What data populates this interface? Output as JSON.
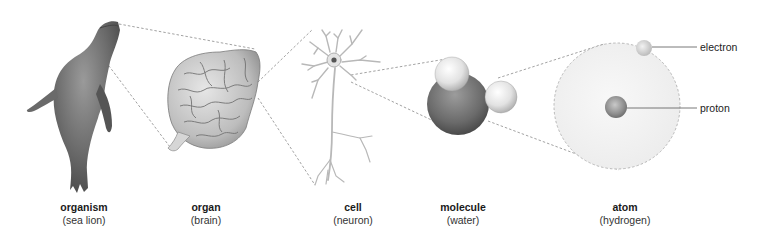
{
  "diagram": {
    "levels": [
      {
        "label": "organism",
        "example": "(sea lion)",
        "x": 84
      },
      {
        "label": "organ",
        "example": "(brain)",
        "x": 206
      },
      {
        "label": "cell",
        "example": "(neuron)",
        "x": 353
      },
      {
        "label": "molecule",
        "example": "(water)",
        "x": 463
      },
      {
        "label": "atom",
        "example": "(hydrogen)",
        "x": 625
      }
    ],
    "callouts": [
      {
        "label": "electron"
      },
      {
        "label": "proton"
      }
    ]
  },
  "colors": {
    "background": "#ffffff",
    "connector": "#8a8a8a",
    "text": "#222222"
  }
}
